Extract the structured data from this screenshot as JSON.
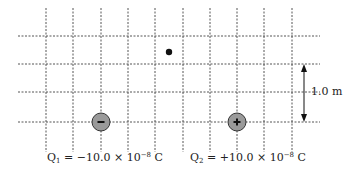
{
  "diagram": {
    "grid": {
      "vertical_x": [
        46,
        73,
        101,
        128,
        155,
        183,
        210,
        237,
        264,
        292
      ],
      "horizontal_y": [
        36,
        64,
        92,
        122
      ],
      "x_span": [
        18,
        320
      ],
      "y_span": [
        8,
        152
      ],
      "line_color": "#555555"
    },
    "point": {
      "x": 169,
      "y": 52,
      "color": "#111111"
    },
    "charges": [
      {
        "id": "Q1",
        "x": 101,
        "y": 122,
        "sign": "-",
        "fill": "#9a9a9a",
        "label": {
          "name": "Q",
          "sub": "1",
          "eq": " = −10.0 × 10",
          "exp": "−8",
          "unit": " C"
        }
      },
      {
        "id": "Q2",
        "x": 237,
        "y": 122,
        "sign": "+",
        "fill": "#9a9a9a",
        "label": {
          "name": "Q",
          "sub": "2",
          "eq": " = +10.0 × 10",
          "exp": "−8",
          "unit": " C"
        }
      }
    ],
    "scale": {
      "label": "1.0 m",
      "x": 304,
      "y_top": 64,
      "y_bottom": 122
    }
  }
}
